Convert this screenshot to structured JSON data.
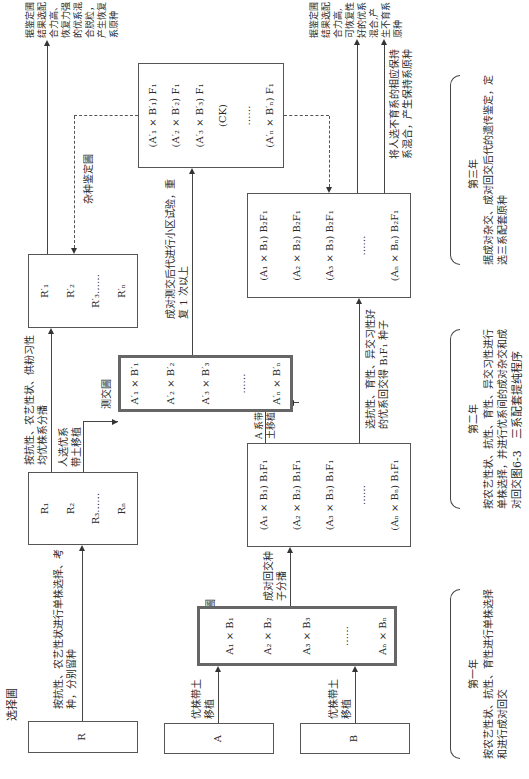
{
  "labels": {
    "selection_nursery": "选择圃",
    "backcross_nursery": "回 交 圃",
    "testcross_nursery": "测交圃",
    "hybrid_identification_nursery": "杂种鉴定圃"
  },
  "boxes": {
    "R": "R",
    "A": "A",
    "B": "B",
    "R_series": [
      "R₁",
      "R₂",
      "R₃……",
      "Rₙ"
    ],
    "backcross_pairs": [
      "A₁ × B₁",
      "A₂ × B₂",
      "A₃ × B₃",
      "……",
      "Aₙ × Bₙ"
    ],
    "b1f1": [
      "(A₁ × B₁) B₁F₁",
      "(A₂ × B₂) B₁F₁",
      "(A₃ × B₃) B₁F₁",
      "……",
      "(Aₙ × Bₙ) B₁F₁"
    ],
    "testcross_pairs": [
      "A′₁ × B′₁",
      "A′₂ × B′₂",
      "A′₃ × B′₃",
      "……",
      "A′ₙ × B′ₙ"
    ],
    "R_prime_series": [
      "R′₁",
      "R′₂",
      "R′₃……",
      "R′ₙ"
    ],
    "b2f1": [
      "(A₁ × B₁) B₂F₁",
      "(A₂ × B₂) B₂F₁",
      "(A₃ × B₃) B₂F₁",
      "……",
      "(Aₙ × Bₙ) B₂F₁"
    ],
    "f1_hybrids": [
      "(A′₁ × B′₁) F₁",
      "(A′₂ × B′₂) F₁",
      "(A′₃ × B′₃) F₁",
      "(CK)",
      "……",
      "(A′ₙ × B′ₙ) F₁"
    ]
  },
  "edges": {
    "r_to_rseries": "按抗性、农艺性状进行单株选择、考种，分别留种",
    "a_to_backcross": "优株带土移植",
    "b_to_backcross": "优株带土移植",
    "backcross_to_b1f1": "成对回交种子分播",
    "rseries_to_rprime": "按抗性、农艺性状、供粉习性均优株系分播",
    "rseries_to_testcross": "人选优系带土移植",
    "b1f1_to_testcross": "A 系带土移植",
    "b1f1_to_b2f1": "选抗性、育性、异交习性好的优系回交得 B₁F₁ 种子",
    "testcross_to_f1": "成对测交后代进行小区试验，重复 1 次以上",
    "rprime_result": "据鉴定圃结果选配合力高、恢复力强的优系混合脱粒，产生恢复系原种",
    "b2f1_result": "据鉴定圃结果选配合力高,可恢复性好的优系混合,产生不育系原种",
    "b2f1_maintainer": "将人选不育系的相应保持系混合，产生保持系原种"
  },
  "years": [
    {
      "label": "第一年",
      "desc": "按农艺性状、抗性、育性进行单株选择和进行成对回交"
    },
    {
      "label": "第二年",
      "desc": "按农艺性状、抗性、育性、异交习性进行单株选择，并进行优系间的成对杂交和成对回交"
    },
    {
      "label": "第三年",
      "desc": "据成对杂交、成对回交后代的遗传鉴定，定选三系配套原种"
    }
  ],
  "caption": "图6-3　三系配套提纯程序"
}
